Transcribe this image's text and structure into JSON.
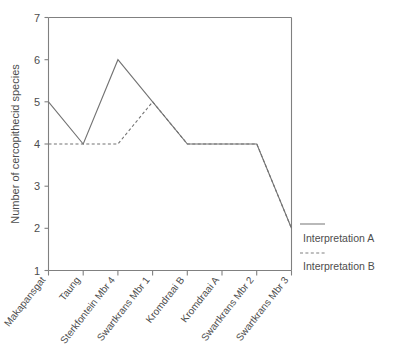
{
  "chart_data": {
    "type": "line",
    "title": "",
    "xlabel": "",
    "ylabel": "Number of cercopithecid species",
    "ylim": [
      1,
      7
    ],
    "yticks": [
      1,
      2,
      3,
      4,
      5,
      6,
      7
    ],
    "ytick_labels": [
      "1",
      "2",
      "3",
      "4",
      "5",
      "6",
      "7"
    ],
    "grid": false,
    "legend_position": "right-inside",
    "categories": [
      "Makapansgat",
      "Taung",
      "Sterkfontein Mbr 4",
      "Swartkrans Mbr 1",
      "Kromdraai B",
      "Kromdraai A",
      "Swartkrans Mbr 2",
      "Swartkrans Mbr 3"
    ],
    "series": [
      {
        "name": "Interpretation A",
        "style": "solid",
        "color": "#737373",
        "values": [
          5,
          4,
          6,
          5,
          4,
          4,
          4,
          2
        ]
      },
      {
        "name": "Interpretation B",
        "style": "dashed",
        "color": "#737373",
        "values": [
          4,
          4,
          4,
          5,
          4,
          4,
          4,
          2
        ]
      }
    ]
  },
  "legend": {
    "items": [
      {
        "label": "Interpretation A",
        "style": "solid"
      },
      {
        "label": "Interpretation B",
        "style": "dashed"
      }
    ]
  },
  "caption": {
    "text": ""
  }
}
